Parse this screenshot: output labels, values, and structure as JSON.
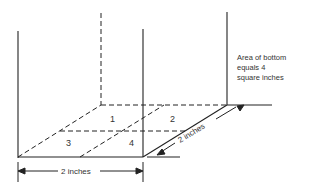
{
  "diagram": {
    "annotation": [
      "Area of bottom",
      "equals 4",
      "square inches"
    ],
    "square_labels": [
      "1",
      "2",
      "3",
      "4"
    ],
    "dimension_width": "2 inches",
    "dimension_depth": "2 inches",
    "line_color": "#222222"
  }
}
